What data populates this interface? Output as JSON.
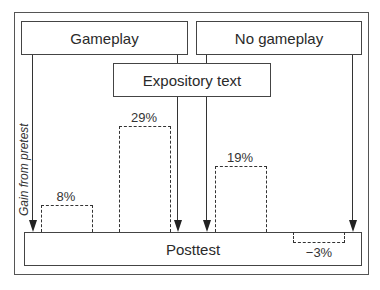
{
  "diagram": {
    "conditions": {
      "gameplay": "Gameplay",
      "no_gameplay": "No gameplay",
      "expository_text": "Expository text"
    },
    "outcome": "Posttest",
    "axis_label": "Gain from pretest",
    "bars": [
      {
        "group": "Gameplay only",
        "value_label": "8%",
        "value": 8
      },
      {
        "group": "Gameplay + Expository text",
        "value_label": "29%",
        "value": 29
      },
      {
        "group": "No gameplay + Expository text",
        "value_label": "19%",
        "value": 19
      },
      {
        "group": "No gameplay only",
        "value_label": "−3%",
        "value": -3
      }
    ]
  }
}
